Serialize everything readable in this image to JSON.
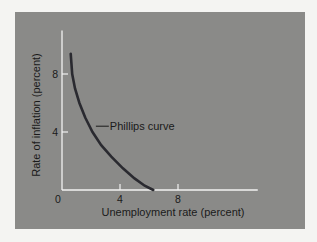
{
  "chart_data": {
    "type": "line",
    "title": "",
    "xlabel": "Unemployment rate (percent)",
    "ylabel": "Rate of inflation (percent)",
    "xlim": [
      0,
      13.5
    ],
    "ylim": [
      0,
      11
    ],
    "xticks": [
      4,
      8
    ],
    "yticks": [
      4,
      8
    ],
    "origin_label": "0",
    "grid": false,
    "series": [
      {
        "name": "Phillips curve",
        "x": [
          0.6,
          0.7,
          0.9,
          1.2,
          1.6,
          2.1,
          2.7,
          3.4,
          4.2,
          5.0,
          5.7,
          6.3
        ],
        "y": [
          9.4,
          8.0,
          7.0,
          6.0,
          5.0,
          4.0,
          3.1,
          2.3,
          1.5,
          0.8,
          0.3,
          0.0
        ]
      }
    ],
    "annotations": [
      {
        "text": "Phillips curve",
        "x": 3.3,
        "y": 4.4,
        "arrow_to": {
          "x": 2.2,
          "y": 4.4
        }
      }
    ]
  }
}
